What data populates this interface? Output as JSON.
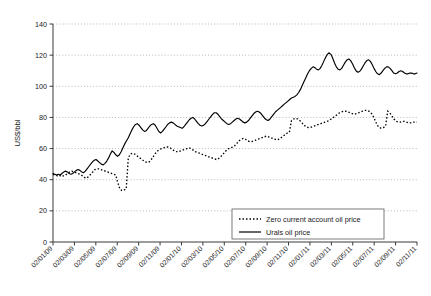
{
  "chart_data": {
    "type": "line",
    "title": "",
    "xlabel": "",
    "ylabel": "US$/bbl",
    "ylim": [
      0,
      140
    ],
    "yticks": [
      0,
      20,
      40,
      60,
      80,
      100,
      120,
      140
    ],
    "grid": true,
    "legend_position": "bottom-right",
    "x_tick_labels": [
      "02/01/09",
      "02/03/09",
      "02/05/09",
      "02/07/09",
      "02/09/09",
      "02/11/09",
      "02/01/10",
      "02/03/10",
      "02/05/10",
      "02/07/10",
      "02/09/10",
      "02/11/10",
      "02/01/11",
      "02/03/11",
      "02/05/11",
      "02/07/11",
      "02/09/11",
      "02/11/11"
    ],
    "series": [
      {
        "name": "Zero current account oil price",
        "style": "dotted",
        "color": "#000000",
        "values": [
          43.5,
          43.0,
          42.5,
          43.0,
          42.0,
          42.5,
          43.0,
          44.0,
          45.0,
          45.5,
          45.0,
          44.5,
          44.0,
          43.5,
          42.5,
          41.5,
          41.0,
          42.0,
          43.5,
          45.0,
          46.5,
          47.0,
          47.0,
          46.5,
          46.0,
          45.5,
          45.0,
          44.5,
          44.0,
          43.5,
          43.0,
          38.0,
          34.0,
          33.0,
          33.5,
          34.0,
          54.0,
          56.5,
          57.0,
          56.5,
          55.5,
          54.5,
          53.5,
          52.5,
          51.5,
          51.0,
          51.5,
          53.0,
          55.0,
          57.0,
          58.5,
          59.5,
          60.0,
          60.5,
          61.0,
          61.0,
          60.5,
          59.5,
          58.5,
          58.0,
          58.0,
          58.5,
          59.0,
          59.5,
          60.0,
          60.5,
          60.0,
          59.0,
          58.0,
          57.5,
          57.0,
          56.5,
          56.0,
          55.5,
          55.0,
          54.5,
          54.0,
          53.5,
          53.0,
          53.5,
          54.5,
          56.0,
          57.5,
          59.0,
          60.0,
          60.5,
          61.0,
          62.0,
          63.5,
          65.0,
          66.0,
          66.5,
          66.0,
          65.0,
          64.5,
          64.5,
          65.0,
          65.5,
          66.0,
          66.5,
          67.0,
          67.5,
          68.0,
          67.5,
          67.0,
          66.5,
          66.0,
          65.5,
          66.0,
          67.0,
          68.0,
          69.0,
          70.0,
          70.5,
          78.0,
          79.0,
          79.5,
          79.0,
          78.0,
          76.5,
          75.0,
          74.0,
          73.5,
          73.5,
          74.0,
          74.5,
          75.0,
          75.5,
          76.0,
          76.5,
          77.0,
          77.5,
          78.0,
          79.0,
          80.0,
          81.0,
          82.0,
          83.0,
          83.5,
          84.0,
          84.0,
          83.5,
          83.0,
          82.5,
          82.0,
          82.5,
          83.0,
          83.5,
          84.0,
          84.5,
          84.5,
          84.0,
          83.0,
          81.0,
          78.0,
          75.0,
          73.5,
          73.0,
          73.5,
          74.5,
          84.0,
          83.0,
          81.0,
          79.0,
          77.5,
          77.0,
          77.0,
          77.5,
          77.5,
          77.0,
          76.5,
          76.5,
          77.0,
          77.0,
          77.0
        ]
      },
      {
        "name": "Urals oil price",
        "style": "solid",
        "color": "#000000",
        "values": [
          44.0,
          43.5,
          43.0,
          43.5,
          43.0,
          44.0,
          45.0,
          45.5,
          45.0,
          44.0,
          43.5,
          44.0,
          45.0,
          46.0,
          46.5,
          46.0,
          45.0,
          44.5,
          45.5,
          47.0,
          48.5,
          50.0,
          51.5,
          52.5,
          53.0,
          52.0,
          51.0,
          50.0,
          49.5,
          50.5,
          52.0,
          54.0,
          56.5,
          58.5,
          57.5,
          56.0,
          55.0,
          56.0,
          58.0,
          60.5,
          63.0,
          65.0,
          67.0,
          69.5,
          72.0,
          74.0,
          75.5,
          76.0,
          75.0,
          73.5,
          72.0,
          71.0,
          71.5,
          73.0,
          74.5,
          75.5,
          76.0,
          75.0,
          73.0,
          71.0,
          70.0,
          71.0,
          72.5,
          74.0,
          75.5,
          76.5,
          77.0,
          76.5,
          75.5,
          74.5,
          74.0,
          73.5,
          73.0,
          74.0,
          75.5,
          77.0,
          78.5,
          79.5,
          80.0,
          79.0,
          77.5,
          76.0,
          75.0,
          74.5,
          75.0,
          76.0,
          77.5,
          79.0,
          80.5,
          82.0,
          83.0,
          83.0,
          82.0,
          80.5,
          79.0,
          78.0,
          77.0,
          76.0,
          75.5,
          76.0,
          77.0,
          78.0,
          79.0,
          79.5,
          79.0,
          78.0,
          77.0,
          76.5,
          77.0,
          78.0,
          79.5,
          81.0,
          82.5,
          83.5,
          84.0,
          83.5,
          82.5,
          81.0,
          79.5,
          78.5,
          78.0,
          79.0,
          80.5,
          82.0,
          83.5,
          84.5,
          85.5,
          86.5,
          87.5,
          88.5,
          89.5,
          90.5,
          91.5,
          92.5,
          93.0,
          93.5,
          94.5,
          96.0,
          98.0,
          100.5,
          103.0,
          105.5,
          108.0,
          110.0,
          111.5,
          112.5,
          112.0,
          111.0,
          110.5,
          111.5,
          113.5,
          116.0,
          118.5,
          120.5,
          121.5,
          120.5,
          118.0,
          115.0,
          112.5,
          111.0,
          110.5,
          111.5,
          113.5,
          115.5,
          117.0,
          117.5,
          116.5,
          114.5,
          112.0,
          110.0,
          109.0,
          109.5,
          111.0,
          113.0,
          115.0,
          116.5,
          117.0,
          116.0,
          114.0,
          111.5,
          109.5,
          108.0,
          107.5,
          108.5,
          110.0,
          111.5,
          112.5,
          112.5,
          111.5,
          110.0,
          108.5,
          108.0,
          108.5,
          109.5,
          110.0,
          109.5,
          108.5,
          108.0,
          108.0,
          108.5,
          108.5,
          108.0,
          108.0,
          108.5
        ]
      }
    ]
  },
  "legend": {
    "entries": [
      {
        "label": "Zero current account oil price",
        "style": "dotted"
      },
      {
        "label": "Urals oil price",
        "style": "solid"
      }
    ]
  }
}
